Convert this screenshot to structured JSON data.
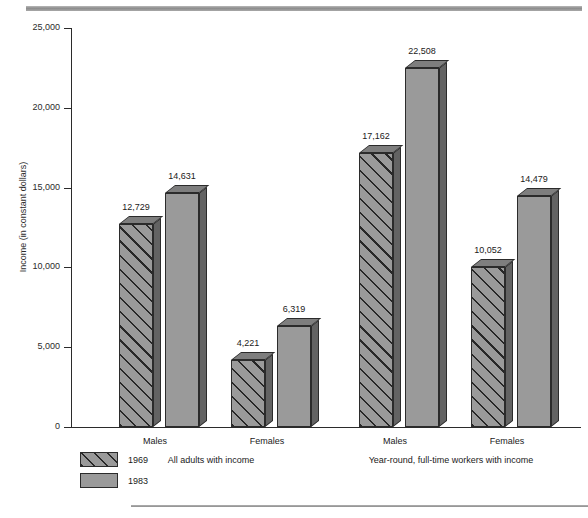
{
  "chart_data": {
    "type": "bar",
    "title": "",
    "subtitle": "",
    "xlabel": "",
    "ylabel": "Income (in constant dollars)",
    "ylim": [
      0,
      25000
    ],
    "ytick_values": [
      25000,
      20000,
      15000,
      10000,
      5000,
      0
    ],
    "ytick_labels": [
      "25,000",
      "20,000",
      "15,000",
      "10,000",
      "5,000",
      "0"
    ],
    "grid": false,
    "legend_position": "bottom-left",
    "categories": [
      "Males",
      "Females",
      "Males",
      "Females"
    ],
    "category_labels": [
      "Males",
      "Females",
      "Males",
      "Females"
    ],
    "group_labels": [
      "All adults with income",
      "Year-round, full-time workers with income"
    ],
    "series": [
      {
        "name": "1969",
        "pattern": "hatched",
        "values": [
          12729,
          4221,
          17162,
          10052
        ],
        "value_labels": [
          "12,729",
          "4,221",
          "17,162",
          "10,052"
        ]
      },
      {
        "name": "1983",
        "pattern": "solid",
        "values": [
          14631,
          6319,
          22508,
          14479
        ],
        "value_labels": [
          "14,631",
          "6,319",
          "22,508",
          "14,479"
        ]
      }
    ],
    "colors": {
      "bar_face": "#9a9a9a",
      "bar_side": "#636363",
      "bar_top": "#7e7e7e",
      "outline": "#2b2b2b",
      "rule": "#8c8c8c",
      "text": "#1a1a1a"
    }
  },
  "legend": {
    "items": [
      {
        "label": "1969",
        "pattern": "hatched"
      },
      {
        "label": "1983",
        "pattern": "solid"
      }
    ]
  },
  "axis": {
    "y_title": "Income (in constant dollars)",
    "ticks": [
      "25,000",
      "20,000",
      "15,000",
      "10,000",
      "5,000",
      "0"
    ]
  }
}
